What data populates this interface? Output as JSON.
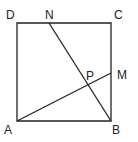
{
  "diagram": {
    "type": "geometry",
    "colors": {
      "stroke": "#222222",
      "background": "#ffffff"
    },
    "points": {
      "A": {
        "label": "A",
        "x": 17,
        "y": 121
      },
      "B": {
        "label": "B",
        "x": 111,
        "y": 121
      },
      "C": {
        "label": "C",
        "x": 111,
        "y": 23
      },
      "D": {
        "label": "D",
        "x": 17,
        "y": 23
      },
      "N": {
        "label": "N",
        "x": 49,
        "y": 23
      },
      "M": {
        "label": "M",
        "x": 111,
        "y": 73
      },
      "P": {
        "label": "P",
        "x": 88,
        "y": 84
      }
    },
    "segments": [
      "AB",
      "BC",
      "CD",
      "DA",
      "BN",
      "AM"
    ]
  }
}
